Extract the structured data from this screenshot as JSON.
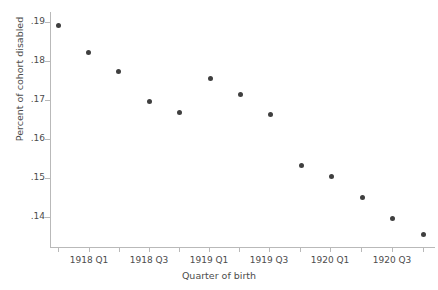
{
  "chart_data": {
    "type": "scatter",
    "title": "",
    "xlabel": "Quarter of birth",
    "ylabel": "Percent of cohort disabled",
    "ylim": [
      0.1344,
      0.1908
    ],
    "yticks": [
      0.19,
      0.18,
      0.17,
      0.16,
      0.15,
      0.14
    ],
    "ytick_labels": [
      ".19",
      ".18",
      ".17",
      ".16",
      ".15",
      ".14"
    ],
    "xticks": [
      "1918 Q1",
      "1918 Q3",
      "1919 Q1",
      "1919 Q3",
      "1920 Q1",
      "1920 Q3"
    ],
    "xtick_labels": [
      "1918 Q1",
      "1918 Q3",
      "1919 Q1",
      "1919 Q3",
      "1920 Q1",
      "1920 Q3"
    ],
    "grid": false,
    "legend": "none",
    "marker_color": "#3f3f3f",
    "axis_color": "#b9b9b9",
    "text_color": "#4c4c4c",
    "x": [
      "1917 Q4",
      "1918 Q1",
      "1918 Q2",
      "1918 Q3",
      "1918 Q4",
      "1919 Q1",
      "1919 Q2",
      "1919 Q3",
      "1919 Q4",
      "1920 Q1",
      "1920 Q2",
      "1920 Q3",
      "1920 Q4"
    ],
    "values": [
      0.1892,
      0.1823,
      0.1772,
      0.1697,
      0.1669,
      0.1756,
      0.1715,
      0.1662,
      0.1533,
      0.1503,
      0.1449,
      0.1395,
      0.1354
    ]
  }
}
